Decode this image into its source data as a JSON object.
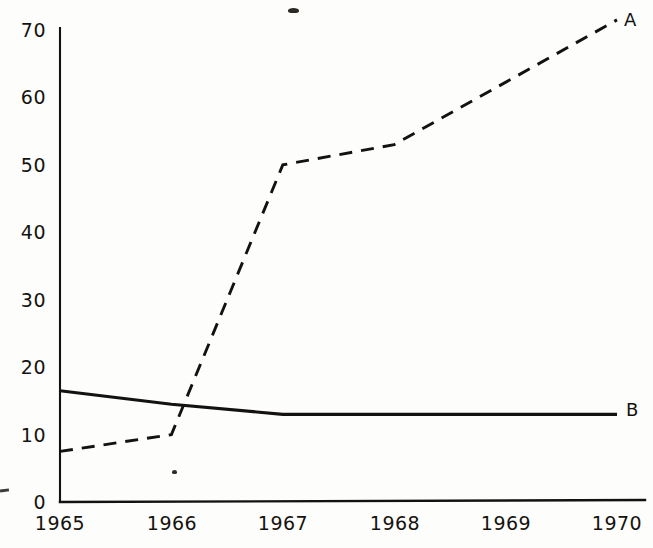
{
  "chart_data": {
    "type": "line",
    "title": "",
    "subtitle": "",
    "xlabel": "",
    "ylabel": "",
    "x": [
      1965,
      1966,
      1967,
      1968,
      1969,
      1970
    ],
    "xtick_labels": [
      "1965",
      "1966",
      "1967",
      "1968",
      "1969",
      "1970"
    ],
    "ytick_labels": [
      "0",
      "10",
      "20",
      "30",
      "40",
      "50",
      "60",
      "70"
    ],
    "ytick_values": [
      0,
      10,
      20,
      30,
      40,
      50,
      60,
      70
    ],
    "xlim": [
      1965,
      1970
    ],
    "ylim": [
      0,
      70
    ],
    "grid": false,
    "legend_position": "right-end-labels",
    "series": [
      {
        "name": "A",
        "label": "A",
        "style": "dashed",
        "color": "#141210",
        "x": [
          1965,
          1966,
          1967,
          1968,
          1970
        ],
        "values": [
          7.5,
          10,
          50,
          53,
          71.5
        ]
      },
      {
        "name": "B",
        "label": "B",
        "style": "solid",
        "color": "#141210",
        "x": [
          1965,
          1966,
          1967,
          1970
        ],
        "values": [
          16.5,
          14.5,
          13,
          13
        ]
      }
    ],
    "axis_color": "#141210",
    "background": "#fdfdfc"
  },
  "annotations": {
    "series_a_end_label": "A",
    "series_b_end_label": "B"
  }
}
